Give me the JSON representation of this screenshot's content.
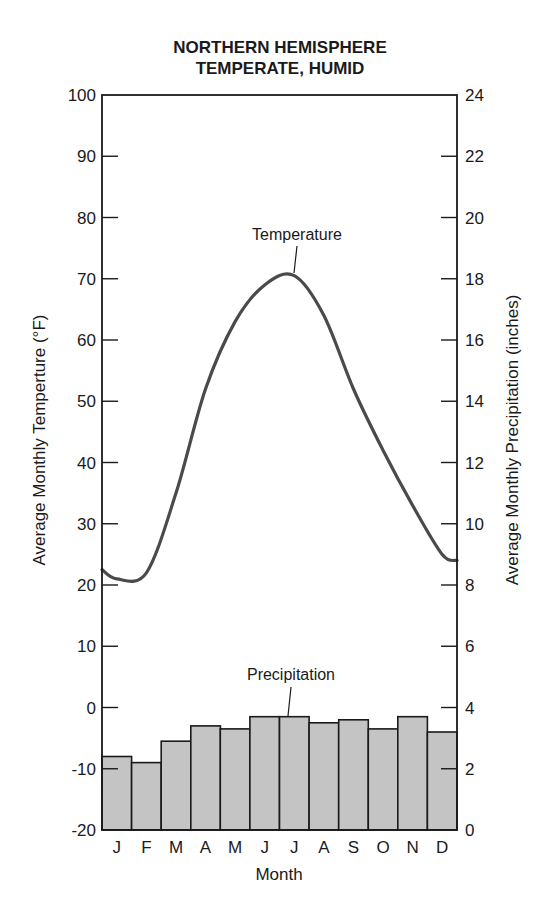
{
  "title_line1": "NORTHERN HEMISPHERE",
  "title_line2": "TEMPERATE, HUMID",
  "chart_data": {
    "type": "bar+line",
    "title": "NORTHERN HEMISPHERE TEMPERATE, HUMID",
    "xlabel": "Month",
    "ylabel_left": "Average Monthly Temperture (°F)",
    "ylabel_right": "Average Monthly Precipitation (inches)",
    "categories": [
      "J",
      "F",
      "M",
      "A",
      "M",
      "J",
      "J",
      "A",
      "S",
      "O",
      "N",
      "D"
    ],
    "ylim_left": [
      -20,
      100
    ],
    "ylim_right": [
      0,
      24
    ],
    "yticks_left": [
      100,
      90,
      80,
      70,
      60,
      50,
      40,
      30,
      20,
      10,
      0,
      -10,
      -20
    ],
    "yticks_right": [
      24,
      22,
      20,
      18,
      16,
      14,
      12,
      10,
      8,
      6,
      4,
      2,
      0
    ],
    "grid": false,
    "series": [
      {
        "name": "Precipitation",
        "type": "bar",
        "axis": "right",
        "unit": "inches",
        "values": [
          2.4,
          2.2,
          2.9,
          3.4,
          3.3,
          3.7,
          3.7,
          3.5,
          3.6,
          3.3,
          3.7,
          3.2
        ],
        "color": "#c4c4c4"
      },
      {
        "name": "Temperature",
        "type": "line",
        "axis": "left",
        "unit": "°F",
        "values": [
          21,
          22,
          35,
          52,
          63,
          69,
          70.5,
          64,
          52,
          42,
          33,
          25
        ],
        "color": "#4a4a4a"
      }
    ],
    "annotations": [
      {
        "text": "Temperature",
        "points_to": "Temperature curve peak (July)"
      },
      {
        "text": "Precipitation",
        "points_to": "July bar"
      }
    ]
  },
  "labels": {
    "temperature_annotation": "Temperature",
    "precipitation_annotation": "Precipitation",
    "x_axis_title": "Month",
    "y_left_title": "Average Monthly Temperture (°F)",
    "y_right_title": "Average Monthly Precipitation (inches)"
  }
}
